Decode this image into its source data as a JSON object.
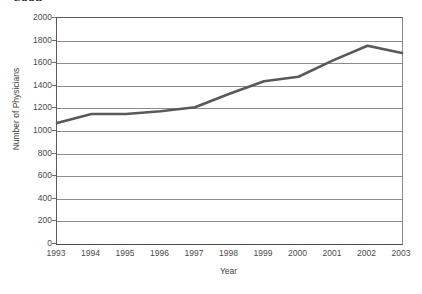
{
  "figure": {
    "clipped_title": "2003",
    "background_color": "#ffffff"
  },
  "chart_data": {
    "type": "line",
    "title": "",
    "xlabel": "Year",
    "ylabel": "Number of Physicians",
    "categories": [
      "1993",
      "1994",
      "1995",
      "1996",
      "1997",
      "1998",
      "1999",
      "2000",
      "2001",
      "2002",
      "2003"
    ],
    "values": [
      1070,
      1150,
      1150,
      1175,
      1210,
      1330,
      1440,
      1480,
      1625,
      1755,
      1690
    ],
    "series": [
      {
        "name": "Number of Physicians",
        "values": [
          1070,
          1150,
          1150,
          1175,
          1210,
          1330,
          1440,
          1480,
          1625,
          1755,
          1690
        ],
        "color": "#595959"
      }
    ],
    "ylim": [
      0,
      2000
    ],
    "yticks": [
      0,
      200,
      400,
      600,
      800,
      1000,
      1200,
      1400,
      1600,
      1800,
      2000
    ],
    "ytick_labels": [
      "0",
      "200",
      "400",
      "600",
      "800",
      "1000",
      "1200",
      "1400",
      "1600",
      "1800",
      "2000"
    ],
    "xtick_labels": [
      "1993",
      "1994",
      "1995",
      "1996",
      "1997",
      "1998",
      "1999",
      "2000",
      "2001",
      "2002",
      "2003"
    ],
    "grid": "horizontal",
    "legend": "none",
    "line_color": "#595959",
    "grid_color": "#8c8c8c",
    "axis_color": "#4a4a4a"
  }
}
